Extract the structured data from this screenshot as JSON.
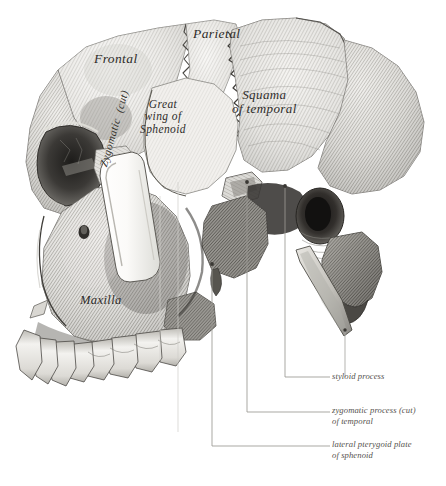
{
  "figure": {
    "background_color": "#ffffff",
    "ink_color": "#3a3834",
    "leader_color": "#9a9894"
  },
  "bone_labels": [
    {
      "id": "frontal",
      "text": "Frontal",
      "style": "italic-script"
    },
    {
      "id": "parietal",
      "text": "Parietal",
      "style": "italic-script"
    },
    {
      "id": "squama",
      "text": "Squama\nof temporal",
      "style": "italic-script"
    },
    {
      "id": "greatwing",
      "text": "Great\nwing of\nSphenoid",
      "style": "italic-script"
    },
    {
      "id": "maxilla",
      "text": "Maxilla",
      "style": "italic-script"
    },
    {
      "id": "zygomatic",
      "text": "Zygomatic  (cut)",
      "style": "italic-script-rotated"
    }
  ],
  "callouts": [
    {
      "id": "styloid",
      "text": "styloid process"
    },
    {
      "id": "zygproc",
      "text": "zygomatic process (cut)\nof temporal"
    },
    {
      "id": "pterygoid",
      "text": "lateral pterygoid plate\nof sphenoid"
    }
  ]
}
